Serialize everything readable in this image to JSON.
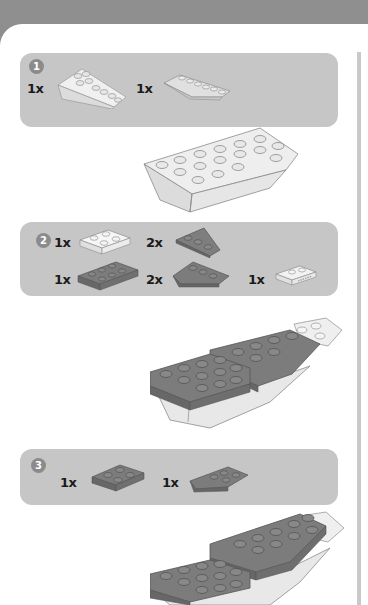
{
  "instructions": {
    "steps": [
      {
        "number": "1",
        "parts": [
          {
            "qty": "1x",
            "icon": "light-gray-inverted-slope-wedge-icon",
            "color": "#e2e2e2"
          },
          {
            "qty": "1x",
            "icon": "light-gray-wedge-plate-icon",
            "color": "#d6d6d6"
          }
        ]
      },
      {
        "number": "2",
        "parts": [
          {
            "qty": "1x",
            "icon": "white-2x2-plate-icon",
            "color": "#f2f2f2"
          },
          {
            "qty": "2x",
            "icon": "dark-gray-wedge-plate-right-icon",
            "color": "#7a7a7a"
          },
          {
            "qty": "1x",
            "icon": "dark-gray-2x4-plate-icon",
            "color": "#7a7a7a"
          },
          {
            "qty": "2x",
            "icon": "dark-gray-wedge-plate-left-icon",
            "color": "#7a7a7a"
          },
          {
            "qty": "1x",
            "icon": "white-plate-with-handle-icon",
            "color": "#ececec"
          }
        ]
      },
      {
        "number": "3",
        "parts": [
          {
            "qty": "1x",
            "icon": "dark-gray-2x2-plate-icon",
            "color": "#7a7a7a"
          },
          {
            "qty": "1x",
            "icon": "dark-gray-wedge-plate-icon",
            "color": "#7a7a7a"
          }
        ]
      }
    ],
    "colors": {
      "header": "#8f8f8f",
      "panel": "#c6c6c6",
      "badge": "#8b8b8b",
      "page": "#ffffff",
      "dark_brick": "#7a7a7a",
      "light_brick": "#e4e4e4"
    }
  }
}
